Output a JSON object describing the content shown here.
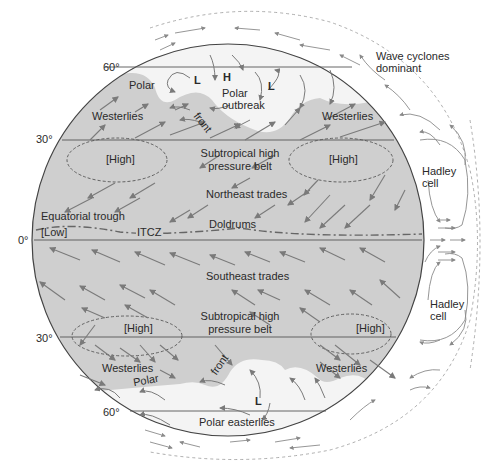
{
  "diagram": {
    "colors": {
      "globe_fill": "#cfcfcf",
      "polar_fill": "#f4f4f4",
      "outline": "#444444",
      "arrow": "#7a7a7a",
      "text": "#2a2a2a"
    },
    "latitudes": {
      "n60": "60°",
      "n30": "30°",
      "eq": "0°",
      "s30": "30°",
      "s60": "60°"
    },
    "north": {
      "polar": "Polar",
      "front": "front",
      "low1": "L",
      "high": "H",
      "low2": "L",
      "polar_outbreak_1": "Polar",
      "polar_outbreak_2": "outbreak",
      "westerlies_left": "Westerlies",
      "westerlies_right": "Westerlies",
      "high_left": "[High]",
      "high_right": "[High]",
      "subtropical_1": "Subtropical high",
      "subtropical_2": "pressure belt",
      "ne_trades": "Northeast trades",
      "doldrums": "Doldrums",
      "equatorial_trough": "Equatorial trough",
      "low": "[Low]",
      "itcz": "ITCZ"
    },
    "south": {
      "se_trades": "Southeast trades",
      "subtropical_1": "Subtropical high",
      "subtropical_2": "pressure belt",
      "high_left": "[High]",
      "high_right": "[High]",
      "westerlies_left": "Westerlies",
      "westerlies_right": "Westerlies",
      "polar": "Polar",
      "front": "front",
      "low": "L",
      "polar_easterlies": "Polar easterlies"
    },
    "side": {
      "wave_1": "Wave cyclones",
      "wave_2": "dominant",
      "hadley_n_1": "Hadley",
      "hadley_n_2": "cell",
      "hadley_s_1": "Hadley",
      "hadley_s_2": "cell"
    }
  }
}
